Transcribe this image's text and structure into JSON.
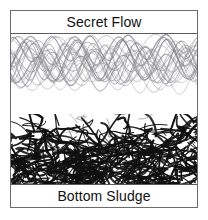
{
  "figure": {
    "title_top": "Secret Flow",
    "title_bottom": "Bottom Sludge",
    "border_color": "#6b6b6b",
    "background": "#ffffff"
  },
  "top_label": {
    "text": "Secret Flow"
  },
  "bottom_label": {
    "text": "Bottom Sludge"
  },
  "flow_layer": {
    "name": "secret-flow",
    "description": "smooth overlapping sinusoidal traces",
    "stroke_color": "#7a7a82",
    "stroke_color_light": "#a8a8b0",
    "wave_count": 26,
    "wave_period_px": 45,
    "amplitude_px": 34,
    "density": "dense at top, sparse at bottom"
  },
  "sludge_layer": {
    "name": "bottom-sludge",
    "description": "dense tangled black scribbles",
    "stroke_color": "#101010",
    "stroke_color_gray": "#555555",
    "segment_count": 260,
    "density": "sparse at top, very dense at bottom"
  }
}
